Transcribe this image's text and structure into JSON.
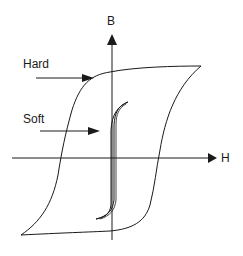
{
  "diagram": {
    "axes": {
      "y_label": "B",
      "x_label": "H"
    },
    "annotations": [
      {
        "label": "Hard",
        "target": "hard-loop"
      },
      {
        "label": "Soft",
        "target": "soft-loop"
      }
    ],
    "colors": {
      "line": "#1a1a1a",
      "background": "#ffffff"
    }
  }
}
